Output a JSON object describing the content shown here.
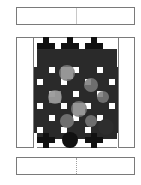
{
  "top_bar": {
    "segments": 2
  },
  "bottom_bar": {
    "segments": 2
  },
  "board": {
    "columns": 7,
    "rows": 9,
    "colors": {
      "black": "#111111",
      "dark": "#3a3a3a",
      "mid": "#6e6e6e",
      "light": "#a8a8a8",
      "white": "#ffffff",
      "border": "#7a7a7a"
    }
  }
}
